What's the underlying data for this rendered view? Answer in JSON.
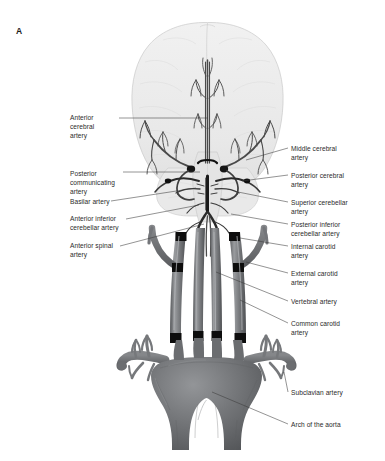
{
  "figure": {
    "panel_letter": "A",
    "background_color": "#ffffff",
    "text_color": "#2b2b2b",
    "colors": {
      "brain_fill": "#ececec",
      "brain_outline": "#c9c9c9",
      "brainstem_fill": "#e2e2e2",
      "artery_dark": "#4a4a4a",
      "artery_black": "#111111",
      "vessel_gray": "#6e7073",
      "vessel_light": "#9a9c9f",
      "vessel_shadow": "#55575a",
      "band_black": "#0d0d0d",
      "leader_line": "#3a3a3a"
    }
  },
  "labels_left": [
    {
      "id": "anterior-cerebral-artery",
      "text": "Anterior\ncerebral\nartery",
      "x": 70,
      "y": 113
    },
    {
      "id": "posterior-communicating-artery",
      "text": "Posterior\ncommunicating\nartery",
      "x": 70,
      "y": 169
    },
    {
      "id": "basilar-artery",
      "text": "Basilar artery",
      "x": 70,
      "y": 199
    },
    {
      "id": "anterior-inferior-cerebellar-artery",
      "text": "Anterior inferior\ncerebellar artery",
      "x": 70,
      "y": 216
    },
    {
      "id": "anterior-spinal-artery",
      "text": "Anterior spinal\nartery",
      "x": 70,
      "y": 243
    }
  ],
  "labels_right": [
    {
      "id": "middle-cerebral-artery",
      "text": "Middle cerebral\nartery",
      "x": 291,
      "y": 145
    },
    {
      "id": "posterior-cerebral-artery",
      "text": "Posterior cerebral\nartery",
      "x": 291,
      "y": 172
    },
    {
      "id": "superior-cerebellar-artery",
      "text": "Superior cerebellar\nartery",
      "x": 291,
      "y": 199
    },
    {
      "id": "posterior-inferior-cerebellar-artery",
      "text": "Posterior inferior\ncerebellar artery",
      "x": 291,
      "y": 221
    },
    {
      "id": "internal-carotid-artery",
      "text": "Internal carotid\nartery",
      "x": 291,
      "y": 243
    },
    {
      "id": "external-carotid-artery",
      "text": "External carotid\nartery",
      "x": 291,
      "y": 270
    },
    {
      "id": "vertebral-artery",
      "text": "Vertebral artery",
      "x": 291,
      "y": 299
    },
    {
      "id": "common-carotid-artery",
      "text": "Common carotid\nartery",
      "x": 291,
      "y": 320
    },
    {
      "id": "subclavian-artery",
      "text": "Subclavian artery",
      "x": 291,
      "y": 390
    },
    {
      "id": "arch-of-the-aorta",
      "text": "Arch of the aorta",
      "x": 291,
      "y": 422
    }
  ],
  "anatomy_regions": [
    {
      "id": "cerebrum",
      "label": "cerebrum silhouette"
    },
    {
      "id": "cerebellum",
      "label": "cerebellum silhouette"
    },
    {
      "id": "circle-of-willis",
      "label": "circle of Willis arterial ring"
    },
    {
      "id": "brainstem",
      "label": "brainstem"
    },
    {
      "id": "neck-vessels",
      "label": "carotid and vertebral trunks"
    },
    {
      "id": "aortic-arch",
      "label": "arch of the aorta"
    }
  ]
}
